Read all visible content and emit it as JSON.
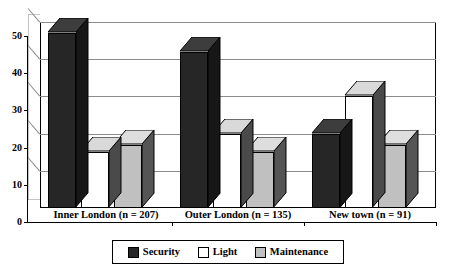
{
  "chart_data": {
    "type": "bar",
    "title": "",
    "subtitle": "",
    "xlabel": "",
    "ylabel": "",
    "ylim": [
      0,
      50
    ],
    "yticks": [
      0,
      10,
      20,
      30,
      40,
      50
    ],
    "ytick_labels": [
      "0",
      "10",
      "20",
      "30",
      "40",
      "50"
    ],
    "grid": true,
    "three_d": true,
    "legend_position": "bottom",
    "categories": [
      "Inner London (n = 207)",
      "Outer London (n = 135)",
      "New town (n = 91)"
    ],
    "series": [
      {
        "name": "Security",
        "color": "#262626",
        "side_color": "#171717",
        "top_color": "#3d3d3d",
        "values": [
          47,
          42,
          20
        ]
      },
      {
        "name": "Light",
        "color": "#ffffff",
        "side_color": "#4a4a4a",
        "top_color": "#d9d9d9",
        "values": [
          15,
          20,
          30
        ]
      },
      {
        "name": "Maintenance",
        "color": "#c0c0c0",
        "side_color": "#555555",
        "top_color": "#dedede",
        "values": [
          17,
          15,
          17
        ]
      }
    ]
  },
  "legend": {
    "items": [
      {
        "label": "Security",
        "color": "#262626"
      },
      {
        "label": "Light",
        "color": "#ffffff"
      },
      {
        "label": "Maintenance",
        "color": "#c0c0c0"
      }
    ]
  },
  "axes": {
    "y_tick_labels": [
      "50",
      "40",
      "30",
      "20",
      "10",
      "0"
    ],
    "x_category_labels": [
      "Inner London (n = 207)",
      "Outer London (n = 135)",
      "New town (n = 91)"
    ]
  },
  "style": {
    "background": "#ffffff",
    "axis_color": "#000000",
    "gridline_color": "#8c8c8c",
    "plot_border_color": "#000000"
  }
}
